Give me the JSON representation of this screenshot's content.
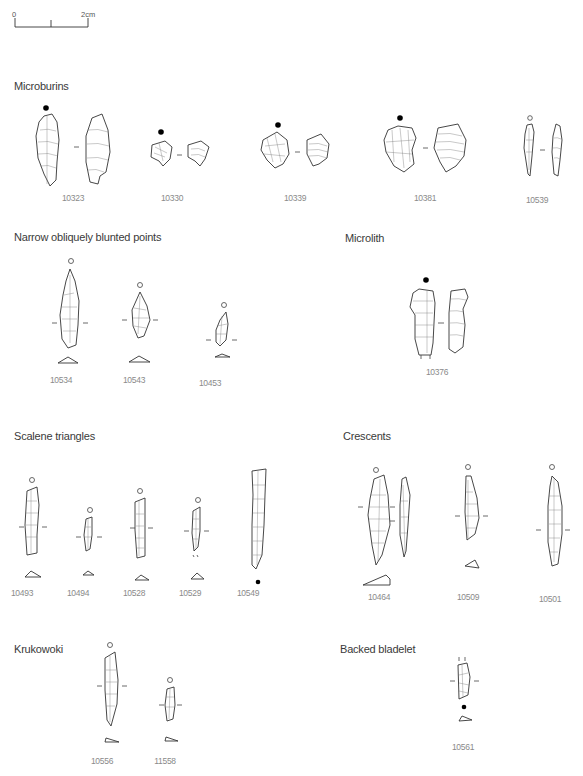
{
  "scale_bar": {
    "start_label": "0",
    "end_label": "2cm"
  },
  "sections": {
    "microburins": {
      "title": "Microburins",
      "items": [
        {
          "id": "10323",
          "marker": "filled-dot"
        },
        {
          "id": "10330",
          "marker": "filled-dot"
        },
        {
          "id": "10339",
          "marker": "filled-dot"
        },
        {
          "id": "10381",
          "marker": "filled-dot"
        },
        {
          "id": "10539",
          "marker": "open-circle"
        }
      ]
    },
    "narrow_points": {
      "title": "Narrow obliquely blunted points",
      "items": [
        {
          "id": "10534",
          "marker": "open-circle"
        },
        {
          "id": "10543",
          "marker": "open-circle"
        },
        {
          "id": "10453",
          "marker": "open-circle"
        }
      ]
    },
    "microlith": {
      "title": "Microlith",
      "items": [
        {
          "id": "10376",
          "marker": "filled-dot"
        }
      ]
    },
    "scalene": {
      "title": "Scalene triangles",
      "items": [
        {
          "id": "10493",
          "marker": "open-circle"
        },
        {
          "id": "10494",
          "marker": "open-circle"
        },
        {
          "id": "10528",
          "marker": "open-circle"
        },
        {
          "id": "10529",
          "marker": "open-circle"
        },
        {
          "id": "10549",
          "marker": "filled-dot"
        }
      ]
    },
    "crescents": {
      "title": "Crescents",
      "items": [
        {
          "id": "10464",
          "marker": "open-circle"
        },
        {
          "id": "10509",
          "marker": "open-circle"
        },
        {
          "id": "10501",
          "marker": "open-circle"
        }
      ]
    },
    "krukowoki": {
      "title": "Krukowoki",
      "items": [
        {
          "id": "10556",
          "marker": "open-circle"
        },
        {
          "id": "11558",
          "marker": "open-circle"
        }
      ]
    },
    "backed_bladelet": {
      "title": "Backed bladelet",
      "items": [
        {
          "id": "10561",
          "marker": "filled-dot"
        }
      ]
    }
  }
}
